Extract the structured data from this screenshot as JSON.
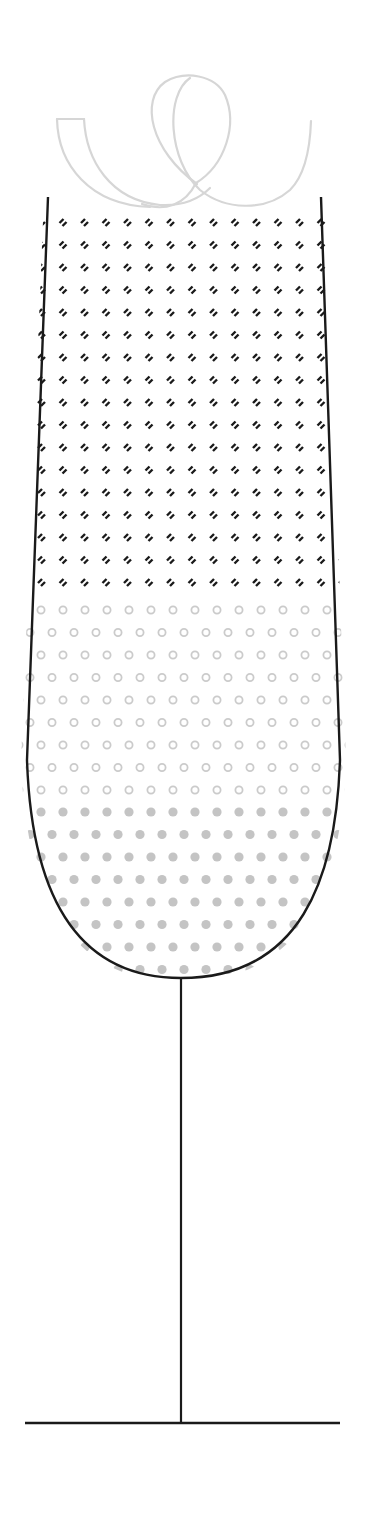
{
  "illustration": {
    "subject": "champagne-flute",
    "width": 369,
    "height": 1528,
    "colors": {
      "outline": "#1a1a1a",
      "ribbon": "#d6d6d6",
      "dash": "#1a1a1a",
      "ring": "#cbcbcb",
      "dot": "#c4c4c4",
      "background": "#ffffff"
    },
    "bowl": {
      "top_y": 197,
      "left_top_x": 48,
      "right_top_x": 321,
      "left_mid": [
        27,
        760
      ],
      "right_mid": [
        340,
        760
      ],
      "bottom": [
        181,
        978
      ]
    },
    "stem": {
      "x": 181,
      "y1": 978,
      "y2": 1423
    },
    "base": {
      "x1": 25,
      "x2": 340,
      "y": 1423
    },
    "fill_layers": [
      {
        "name": "dashes",
        "type": "dash",
        "rows": 17,
        "y_start": 222,
        "row_gap": 22.5,
        "x_start": 42,
        "col_gap": 21.5,
        "stagger": false
      },
      {
        "name": "rings",
        "type": "ring",
        "rows": 9,
        "y_start": 610,
        "row_gap": 22.5,
        "x_start": 41,
        "col_gap": 22,
        "stagger": true
      },
      {
        "name": "dots",
        "type": "dot",
        "rows": 8,
        "y_start": 812,
        "row_gap": 22.5,
        "x_start": 41,
        "col_gap": 22,
        "stagger": true
      }
    ]
  }
}
